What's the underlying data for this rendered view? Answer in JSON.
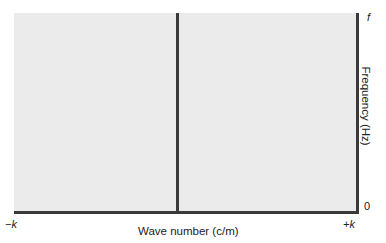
{
  "chart_data": {
    "type": "diagram",
    "xlabel": "Wave number (c/m)",
    "ylabel": "Frequency (Hz)",
    "x_ticks": [
      "-k",
      "+k"
    ],
    "y_ticks": [
      "0",
      "f"
    ],
    "center_line_at": "k = 0",
    "colors": {
      "plot_fill": "#ebebeb",
      "axes": "#3a3a3a"
    }
  },
  "labels": {
    "x_min": "−k",
    "x_max": "+k",
    "x_axis": "Wave number (c/m)",
    "y_top": "f",
    "y_zero": "0",
    "y_axis": "Frequency (Hz)"
  }
}
